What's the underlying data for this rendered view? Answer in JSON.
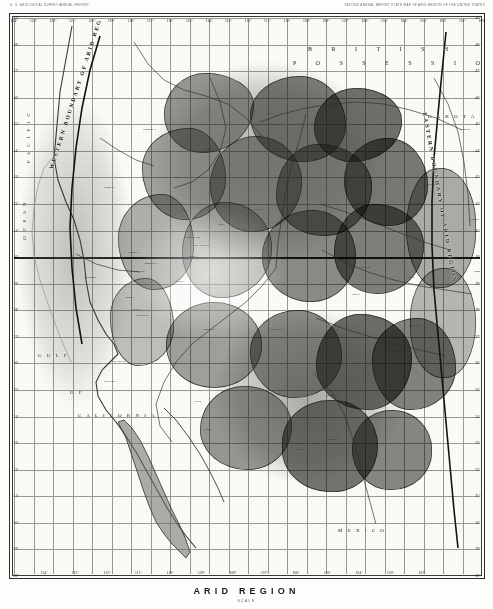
{
  "header": {
    "credit_left": "U. S. GEOLOGICAL SURVEY   ANNUAL REPORT",
    "credit_right": "SECOND ANNUAL REPORT  PLATE  MAP OF  ARID  REGION  OF  THE  UNITED  STATES"
  },
  "caption": {
    "title": "ARID REGION",
    "subtitle": "SCALE"
  },
  "map": {
    "longitude_ticks_top": [
      "124°",
      "123°",
      "122°",
      "121°",
      "120°",
      "119°",
      "118°",
      "117°",
      "116°",
      "115°",
      "114°",
      "113°",
      "112°",
      "111°",
      "110°",
      "109°",
      "108°",
      "107°",
      "106°",
      "105°",
      "104°",
      "103°",
      "102°",
      "101°",
      "100°"
    ],
    "longitude_ticks_bottom": [
      "114°",
      "113°",
      "112°",
      "111°",
      "110°",
      "109°",
      "108°",
      "107°",
      "106°",
      "105°",
      "104°",
      "103°",
      "102°"
    ],
    "latitude_ticks_left": [
      "49°",
      "48°",
      "47°",
      "46°",
      "45°",
      "44°",
      "43°",
      "42°",
      "41°",
      "40°",
      "39°",
      "38°",
      "37°",
      "36°",
      "35°",
      "34°",
      "33°",
      "32°",
      "31°",
      "30°",
      "29°",
      "28°"
    ],
    "latitude_ticks_right": [
      "49°",
      "48°",
      "47°",
      "46°",
      "45°",
      "44°",
      "43°",
      "42°",
      "41°",
      "40°",
      "39°",
      "38°",
      "37°",
      "36°",
      "35°",
      "34°",
      "33°",
      "32°",
      "31°",
      "30°",
      "29°",
      "28°"
    ],
    "boundary_west_label": "WESTERN BOUNDARY OF ARID REGION",
    "boundary_east_label": "EASTERN BOUNDARY OF ARID REGION",
    "area_labels": [
      {
        "text": "B R I T I S H",
        "x": 300,
        "y": 38
      },
      {
        "text": "P O S S E S S I O N S",
        "x": 285,
        "y": 52
      },
      {
        "text": "D A K O T A",
        "x": 420,
        "y": 106
      },
      {
        "text": "G U L F",
        "x": 30,
        "y": 345
      },
      {
        "text": "O F",
        "x": 62,
        "y": 382
      },
      {
        "text": "C A L I F O R N I A",
        "x": 70,
        "y": 405
      },
      {
        "text": "P A C I F I C",
        "x": 18,
        "y": 155
      },
      {
        "text": "O C E A N",
        "x": 14,
        "y": 232
      },
      {
        "text": "M E X I C O",
        "x": 330,
        "y": 520
      }
    ],
    "place_labels": [
      {
        "text": "Great Salt Lake",
        "x": 176,
        "y": 228
      },
      {
        "text": "Utah L.",
        "x": 181,
        "y": 247
      },
      {
        "text": "Sevier L.",
        "x": 167,
        "y": 272
      },
      {
        "text": "Pyramid L.",
        "x": 120,
        "y": 243
      },
      {
        "text": "Yellowstone L.",
        "x": 287,
        "y": 152
      },
      {
        "text": "Snake R.",
        "x": 205,
        "y": 168
      },
      {
        "text": "Colorado R.",
        "x": 195,
        "y": 320
      },
      {
        "text": "Rio Grande",
        "x": 318,
        "y": 430
      },
      {
        "text": "Platte R.",
        "x": 398,
        "y": 268
      },
      {
        "text": "Missouri R.",
        "x": 420,
        "y": 175
      },
      {
        "text": "Columbia R.",
        "x": 135,
        "y": 120
      },
      {
        "text": "Arkansas R.",
        "x": 400,
        "y": 316
      },
      {
        "text": "STAKED PLAINS",
        "x": 378,
        "y": 342
      },
      {
        "text": "Green R.",
        "x": 246,
        "y": 200
      },
      {
        "text": "Humboldt R.",
        "x": 136,
        "y": 254
      },
      {
        "text": "Gila R.",
        "x": 186,
        "y": 392
      },
      {
        "text": "Pecos R.",
        "x": 352,
        "y": 418
      },
      {
        "text": "Canadian R.",
        "x": 408,
        "y": 352
      },
      {
        "text": "Salmon R.",
        "x": 196,
        "y": 140
      },
      {
        "text": "Bear L.",
        "x": 210,
        "y": 215
      },
      {
        "text": "Klamath L.",
        "x": 96,
        "y": 178
      },
      {
        "text": "Carson Sink",
        "x": 124,
        "y": 262
      },
      {
        "text": "Death Valley",
        "x": 128,
        "y": 306
      },
      {
        "text": "Mono L.",
        "x": 118,
        "y": 288
      },
      {
        "text": "Owens L.",
        "x": 124,
        "y": 300
      },
      {
        "text": "San Juan R.",
        "x": 262,
        "y": 320
      },
      {
        "text": "Laramie",
        "x": 330,
        "y": 250
      },
      {
        "text": "Cheyenne",
        "x": 352,
        "y": 258
      },
      {
        "text": "Denver",
        "x": 344,
        "y": 285
      },
      {
        "text": "Santa Fe",
        "x": 318,
        "y": 386
      },
      {
        "text": "Salt Lake City",
        "x": 186,
        "y": 236
      },
      {
        "text": "Helena",
        "x": 258,
        "y": 104
      },
      {
        "text": "Boise",
        "x": 166,
        "y": 168
      },
      {
        "text": "Sacramento",
        "x": 76,
        "y": 268
      },
      {
        "text": "Los Angeles",
        "x": 104,
        "y": 352
      },
      {
        "text": "San Diego",
        "x": 96,
        "y": 372
      },
      {
        "text": "Tucson",
        "x": 196,
        "y": 420
      },
      {
        "text": "El Paso",
        "x": 288,
        "y": 440
      },
      {
        "text": "Bismarck",
        "x": 452,
        "y": 120
      },
      {
        "text": "Yankton",
        "x": 462,
        "y": 210
      },
      {
        "text": "Omaha",
        "x": 466,
        "y": 262
      }
    ]
  },
  "colors": {
    "frame": "#2b2b2b",
    "graticule": "#9a9a93",
    "paper": "#fcfcf9",
    "shade_dark": "#4a4a46",
    "shade_mid": "#6e6e68",
    "shade_light": "#9d9d96"
  }
}
